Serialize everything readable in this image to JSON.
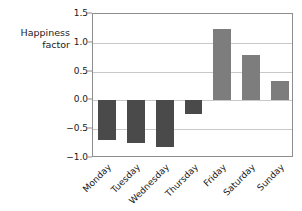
{
  "chart_data": {
    "type": "bar",
    "title": "",
    "subtitle": "",
    "xlabel": "",
    "ylabel": "Happiness\nfactor",
    "categories": [
      "Monday",
      "Tuesday",
      "Wednesday",
      "Thursday",
      "Friday",
      "Saturday",
      "Sunday"
    ],
    "values": [
      -0.69,
      -0.74,
      -0.81,
      -0.24,
      1.24,
      0.78,
      0.34
    ],
    "ylim": [
      -1.0,
      1.5
    ],
    "yticks": [
      1.5,
      1.0,
      0.5,
      0.0,
      -0.5,
      -1.0
    ],
    "ytick_labels": [
      "1.5",
      "1.0",
      "0.5",
      "0.0",
      "-0.5",
      "-1.0"
    ],
    "grid": true,
    "legend": null,
    "legend_position": "none",
    "annotations": [],
    "xtick_rotation": -45,
    "bar_colors": {
      "negative": "#4a4a4a",
      "positive": "#7d7d7d"
    },
    "axis_color": "#8d8d8d",
    "gridline_color": "#c9c9c9",
    "text_color": "#1a1a1a",
    "background": "#ffffff"
  }
}
